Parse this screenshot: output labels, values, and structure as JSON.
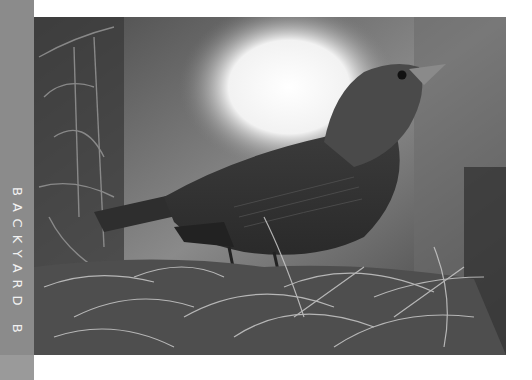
{
  "sidebar": {
    "label": "BACKYARD B",
    "color": "#8b8b8b"
  },
  "photo": {
    "subject": "bird perched on moss",
    "alt": "Grayscale photograph of a bird perched on Spanish moss"
  }
}
